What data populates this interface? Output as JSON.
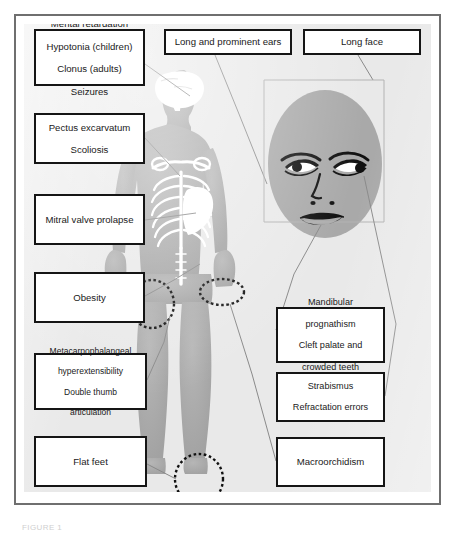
{
  "figure": {
    "caption": "FIGURE 1",
    "colors": {
      "frame": "#6f6f6f",
      "plate_background": "#e9e9e9",
      "body_silhouette": "#a9a9a9",
      "skeleton": "#ffffff",
      "box_border": "#151515",
      "box_background": "#ffffff",
      "leader_line": "#8a8a8a",
      "highlight_circle": "#111111",
      "text": "#1a1a1a"
    }
  },
  "labels": {
    "neuro": {
      "name": "neurologic-features",
      "lines": [
        "Mental retardation",
        "Hypotonia (children)",
        "Clonus (adults)",
        "Seizures"
      ]
    },
    "chest": {
      "name": "skeletal-features",
      "lines": [
        "Pectus excarvatum",
        "Scoliosis"
      ]
    },
    "mitral": {
      "name": "cardiac-features",
      "lines": [
        "Mitral valve prolapse"
      ]
    },
    "obesity": {
      "name": "obesity",
      "lines": [
        "Obesity"
      ]
    },
    "mcp": {
      "name": "joint-features",
      "lines": [
        "Metacarpophalangeal",
        "hyperextensibility",
        "Double thumb",
        "articulation"
      ]
    },
    "flatfeet": {
      "name": "flat-feet",
      "lines": [
        "Flat feet"
      ]
    },
    "ears": {
      "name": "ear-features",
      "lines": [
        "Long and prominent ears"
      ]
    },
    "longface": {
      "name": "face-shape",
      "lines": [
        "Long face"
      ]
    },
    "mandibular": {
      "name": "oral-features",
      "lines": [
        "Mandibular",
        "prognathism",
        "Cleft palate and",
        "crowded teeth"
      ]
    },
    "strabismus": {
      "name": "ocular-features",
      "lines": [
        "Strabismus",
        "Refractation errors"
      ]
    },
    "macro": {
      "name": "macroorchidism",
      "lines": [
        "Macroorchidism"
      ]
    }
  },
  "anatomy": {
    "figures": [
      {
        "name": "body-silhouette",
        "description": "Gray anterior full-body human silhouette"
      },
      {
        "name": "brain-overlay",
        "description": "White brain inside the head"
      },
      {
        "name": "ribcage-overlay",
        "description": "White ribcage, clavicles and spine"
      },
      {
        "name": "heart-overlay",
        "description": "White heart in the left chest"
      },
      {
        "name": "face-portrait",
        "description": "Gray oval face with eyes, nose and mouth"
      }
    ],
    "highlight_circles": [
      {
        "name": "hand-highlight-circle",
        "target": "right hand"
      },
      {
        "name": "groin-highlight-circle",
        "target": "groin / testes"
      },
      {
        "name": "foot-highlight-circle",
        "target": "feet"
      }
    ]
  }
}
